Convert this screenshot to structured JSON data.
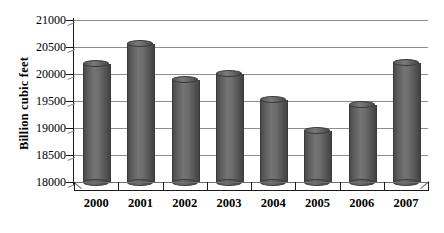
{
  "chart_data": {
    "type": "bar",
    "title": "",
    "subtitle": "",
    "xlabel": "",
    "ylabel": "Billion cubic feet",
    "categories": [
      "2000",
      "2001",
      "2002",
      "2003",
      "2004",
      "2005",
      "2006",
      "2007"
    ],
    "values": [
      20180,
      20550,
      19880,
      20000,
      19520,
      18950,
      19430,
      20200
    ],
    "series": [
      {
        "name": "Natural gas",
        "values": [
          20180,
          20550,
          19880,
          20000,
          19520,
          18950,
          19430,
          20200
        ]
      }
    ],
    "ylim": [
      18000,
      21000
    ],
    "ytick_labels": [
      "21000",
      "20500",
      "20000",
      "19500",
      "19000",
      "18500",
      "18000"
    ],
    "ytick_values": [
      21000,
      20500,
      20000,
      19500,
      19000,
      18500,
      18000
    ],
    "grid": true,
    "legend": false,
    "legend_position": "none",
    "bar_style": "cylinder-3d",
    "bar_color": "#5e5e5e",
    "gridline_color": "#8d8d8d",
    "axis_color": "#1a1a1a",
    "background_color": "#ffffff"
  },
  "axes": {
    "y_title": "Billion cubic feet",
    "y_tick_labels": [
      "21000",
      "20500",
      "20000",
      "19500",
      "19000",
      "18500",
      "18000"
    ],
    "x_tick_labels": [
      "2000",
      "2001",
      "2002",
      "2003",
      "2004",
      "2005",
      "2006",
      "2007"
    ]
  }
}
